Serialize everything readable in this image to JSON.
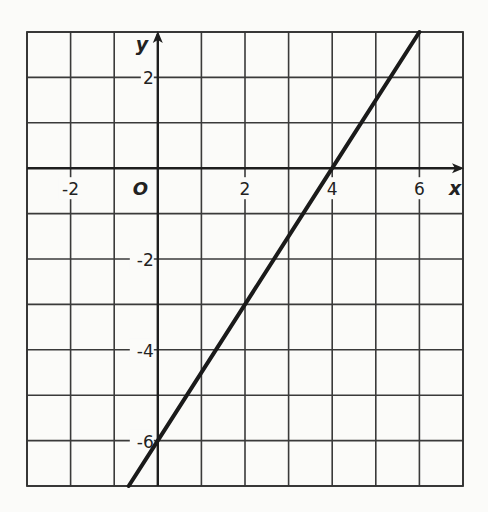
{
  "chart_data": {
    "type": "line",
    "title": "",
    "xlabel": "x",
    "ylabel": "y",
    "origin_label": "O",
    "xlim": [
      -3,
      7
    ],
    "ylim": [
      -7,
      3
    ],
    "grid": true,
    "grid_step": 1,
    "x_tick_labels": [
      {
        "value": -2,
        "label": "-2"
      },
      {
        "value": 2,
        "label": "2"
      },
      {
        "value": 4,
        "label": "4"
      },
      {
        "value": 6,
        "label": "6"
      }
    ],
    "y_tick_labels": [
      {
        "value": 2,
        "label": "2"
      },
      {
        "value": -2,
        "label": "-2"
      },
      {
        "value": -4,
        "label": "-4"
      },
      {
        "value": -6,
        "label": "-6"
      }
    ],
    "series": [
      {
        "name": "line",
        "equation": "y = 1.5x - 6",
        "slope": 1.5,
        "intercept": -6,
        "x": [
          -0.667,
          0,
          4,
          6
        ],
        "y": [
          -7,
          -6,
          0,
          3
        ]
      }
    ],
    "legend": null
  },
  "colors": {
    "background": "#fbfbf9",
    "grid": "#3a3a3a",
    "line": "#1a1a1a"
  }
}
